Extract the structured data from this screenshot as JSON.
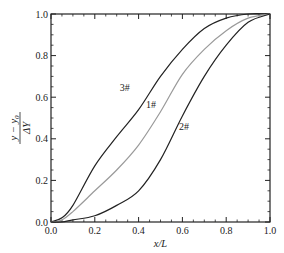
{
  "chart_data": {
    "type": "line",
    "title": "",
    "xlabel": "x/L",
    "ylabel": "(y − y0)/ΔY",
    "ylabel_parts": {
      "numerator": "y − y",
      "numerator_sub": "0",
      "denominator": "ΔY"
    },
    "xlim": [
      0.0,
      1.0
    ],
    "ylim": [
      0.0,
      1.0
    ],
    "x_ticks": [
      "0.0",
      "0.2",
      "0.4",
      "0.6",
      "0.8",
      "1.0"
    ],
    "y_ticks": [
      "0.0",
      "0.2",
      "0.4",
      "0.6",
      "0.8",
      "1.0"
    ],
    "grid": false,
    "legend_position": "inline labels",
    "x": [
      0.0,
      0.05,
      0.1,
      0.2,
      0.3,
      0.4,
      0.5,
      0.6,
      0.7,
      0.8,
      0.9,
      1.0
    ],
    "series": [
      {
        "name": "3#",
        "color": "#222222",
        "label_pos": [
          0.36,
          0.63
        ],
        "values": [
          0.0,
          0.02,
          0.08,
          0.27,
          0.41,
          0.54,
          0.7,
          0.83,
          0.93,
          0.98,
          1.0,
          1.0
        ]
      },
      {
        "name": "1#",
        "color": "#9a9a9a",
        "label_pos": [
          0.48,
          0.55
        ],
        "values": [
          0.0,
          0.01,
          0.05,
          0.15,
          0.25,
          0.37,
          0.53,
          0.71,
          0.83,
          0.92,
          0.98,
          1.0
        ]
      },
      {
        "name": "2#",
        "color": "#222222",
        "label_pos": [
          0.63,
          0.44
        ],
        "values": [
          0.0,
          0.0,
          0.01,
          0.03,
          0.08,
          0.15,
          0.3,
          0.51,
          0.7,
          0.85,
          0.96,
          1.0
        ]
      }
    ]
  }
}
